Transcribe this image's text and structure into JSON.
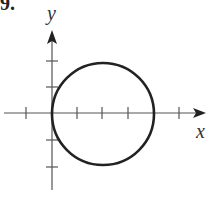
{
  "problem": {
    "number": "9."
  },
  "graph": {
    "x_axis_label": "x",
    "y_axis_label": "y",
    "curve": "circle",
    "circle": {
      "center": [
        2,
        0
      ],
      "radius": 2
    },
    "x_ticks": [
      -1,
      1,
      2,
      3,
      5
    ],
    "y_ticks": [
      -2,
      -1,
      1,
      2
    ],
    "colors": {
      "axis": "#555555",
      "curve": "#222222"
    }
  }
}
